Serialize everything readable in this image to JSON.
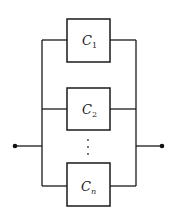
{
  "diagram": {
    "type": "parallel-system-block-diagram",
    "components": [
      {
        "id": "c1",
        "letter": "C",
        "subscript": "1"
      },
      {
        "id": "c2",
        "letter": "C",
        "subscript": "2"
      },
      {
        "id": "cn",
        "letter": "C",
        "subscript": "n"
      }
    ],
    "ellipsis": "⋮",
    "input_node": "input",
    "output_node": "output"
  }
}
